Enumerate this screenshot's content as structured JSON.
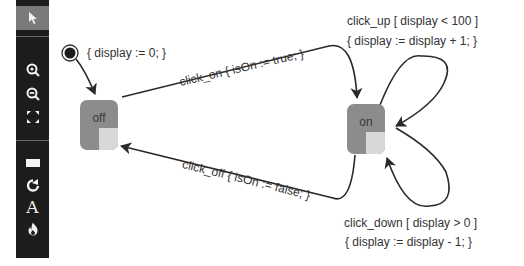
{
  "toolbar": {
    "tools": [
      {
        "name": "select",
        "icon": "pointer-icon",
        "active": true
      },
      {
        "name": "zoom-in",
        "icon": "zoom-in-icon"
      },
      {
        "name": "zoom-out",
        "icon": "zoom-out-icon"
      },
      {
        "name": "fit",
        "icon": "fit-screen-icon"
      },
      {
        "name": "state",
        "icon": "rectangle-icon"
      },
      {
        "name": "transition",
        "icon": "redirect-arrow-icon"
      },
      {
        "name": "text",
        "icon": "text-icon",
        "glyph": "A"
      },
      {
        "name": "fire",
        "icon": "fire-icon"
      }
    ]
  },
  "diagram": {
    "initial": {
      "action": "{ display := 0; }"
    },
    "states": [
      {
        "id": "off",
        "label": "off"
      },
      {
        "id": "on",
        "label": "on"
      }
    ],
    "transitions": {
      "click_on": "click_on { isOn := true; }",
      "click_off": "click_off { isOn := false; }",
      "click_up_line1": "click_up [ display < 100 ]",
      "click_up_line2": "{ display := display + 1; }",
      "click_down_line1": "click_down [ display > 0 ]",
      "click_down_line2": "{ display := display - 1; }"
    },
    "colors": {
      "state_fill": "#8c8c8c",
      "state_quadrant": "#d8d8d8",
      "line": "#2a2a2a",
      "toolbar_bg": "#1c1c1c",
      "toolbar_active": "#7a7a7a"
    }
  }
}
